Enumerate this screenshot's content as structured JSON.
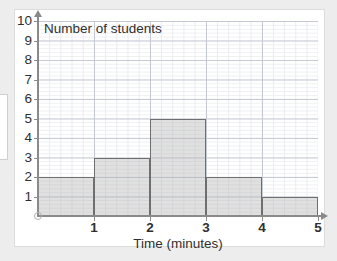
{
  "chart_data": {
    "type": "bar",
    "title": "",
    "xlabel": "Time (minutes)",
    "ylabel": "Number of students",
    "xlim": [
      0,
      5
    ],
    "ylim": [
      0,
      10
    ],
    "grid": true,
    "legend": null,
    "bin_edges": [
      0,
      1,
      2,
      3,
      4,
      5
    ],
    "categories": [
      "0-1",
      "1-2",
      "2-3",
      "3-4",
      "4-5"
    ],
    "values": [
      2,
      3,
      5,
      2,
      1
    ],
    "xticks": [
      1,
      2,
      3,
      4,
      5
    ],
    "xtick_labels": [
      "1",
      "2",
      "3",
      "4",
      "5"
    ],
    "yticks": [
      1,
      2,
      3,
      4,
      5,
      6,
      7,
      8,
      9,
      10
    ],
    "ytick_labels": [
      "1",
      "2",
      "3",
      "4",
      "5",
      "6",
      "7",
      "8",
      "9",
      "10"
    ],
    "bar_fill_color": "#b2b2b2",
    "bar_edge_color": "#6f6f6f",
    "axis_color": "#8a8a8a",
    "grid_major_color": "#c4c9d4",
    "grid_minor_color": "#e9ebf0",
    "background_color": "#ffffff",
    "page_background_color": "#ededed",
    "origin_marker": "open-circle"
  }
}
